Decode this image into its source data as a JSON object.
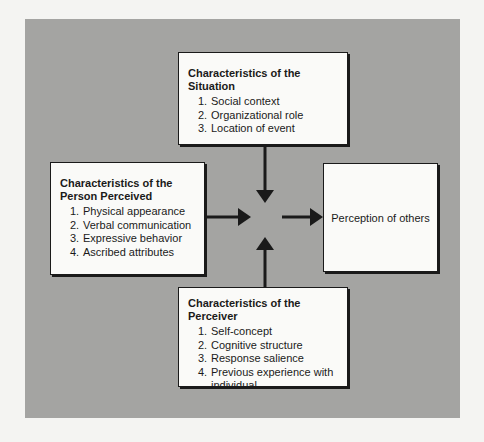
{
  "diagram": {
    "type": "flow",
    "situation": {
      "title": "Characteristics of the Situation",
      "items": [
        {
          "num": "1.",
          "text": "Social context"
        },
        {
          "num": "2.",
          "text": "Organizational role"
        },
        {
          "num": "3.",
          "text": "Location of event"
        }
      ]
    },
    "person_perceived": {
      "title_line1": "Characteristics of the",
      "title_line2": "Person Perceived",
      "items": [
        {
          "num": "1.",
          "text": "Physical appearance"
        },
        {
          "num": "2.",
          "text": "Verbal communication"
        },
        {
          "num": "3.",
          "text": "Expressive behavior"
        },
        {
          "num": "4.",
          "text": "Ascribed attributes"
        }
      ]
    },
    "perceiver": {
      "title": "Characteristics of the Perceiver",
      "items": [
        {
          "num": "1.",
          "text": "Self-concept"
        },
        {
          "num": "2.",
          "text": "Cognitive structure"
        },
        {
          "num": "3.",
          "text": "Response salience"
        },
        {
          "num": "4.",
          "text": "Previous experience with individual"
        }
      ]
    },
    "outcome": {
      "label": "Perception of others"
    },
    "edges": [
      {
        "from": "situation",
        "to": "center",
        "direction": "down"
      },
      {
        "from": "person_perceived",
        "to": "center",
        "direction": "right"
      },
      {
        "from": "perceiver",
        "to": "center",
        "direction": "up"
      },
      {
        "from": "center",
        "to": "outcome",
        "direction": "right"
      }
    ],
    "colors": {
      "panel": "#a4a4a2",
      "box": "#fafaf8",
      "stroke": "#1a1a1a"
    }
  }
}
